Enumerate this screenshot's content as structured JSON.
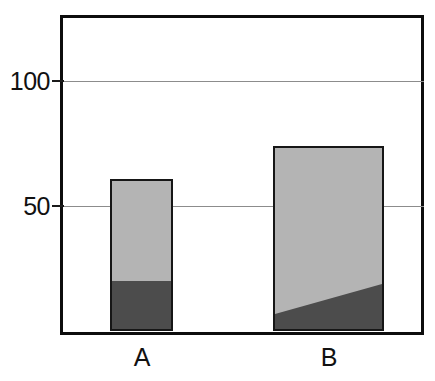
{
  "chart_data": {
    "type": "bar",
    "title": "",
    "subtitle": "",
    "xlabel": "",
    "ylabel": "",
    "categories": [
      "A",
      "B"
    ],
    "stacked": true,
    "ylim": [
      0,
      128
    ],
    "yticks": [
      50,
      100
    ],
    "ytick_labels": [
      "50",
      "100"
    ],
    "grid": true,
    "gridlines_at": [
      50,
      100
    ],
    "legend": null,
    "legend_position": "none",
    "series": [
      {
        "name": "lower-segment",
        "color": "#4c4c4c",
        "values": [
          21,
          12
        ]
      },
      {
        "name": "upper-segment",
        "color": "#b4b4b4",
        "values": [
          40,
          62
        ]
      }
    ],
    "totals": [
      61,
      74
    ],
    "annotations": [
      "Bar B lower segment boundary is a diagonal: rises from about 6 at the left edge to about 18 at the right edge.",
      "Bar A lower segment boundary is horizontal at about 21."
    ],
    "colors": {
      "light_fill": "#b4b4b4",
      "dark_fill": "#4c4c4c",
      "bar_outline": "#161616",
      "frame": "#0d0d0d",
      "gridline": "#8c8c8c",
      "background": "#ffffff",
      "text": "#111111"
    }
  },
  "axis": {
    "y": {
      "tick_100": "100",
      "tick_50": "50"
    },
    "x": {
      "cat_a": "A",
      "cat_b": "B"
    }
  }
}
